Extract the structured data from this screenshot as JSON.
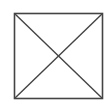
{
  "diagram": {
    "shape": "square-with-diagonals",
    "stroke_color": "#444444",
    "background_color": "#ffffff",
    "square": {
      "x1": 14.5,
      "y1": 13.5,
      "x2": 102.5,
      "y2": 98.5
    },
    "stroke_width": 1.6
  }
}
